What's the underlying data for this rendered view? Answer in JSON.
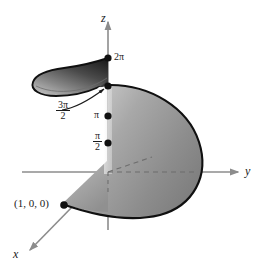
{
  "figure": {
    "background_color": "#ffffff",
    "axes": {
      "x_label": "x",
      "y_label": "y",
      "z_label": "z",
      "axis_color": "#8c8c8c"
    },
    "z_ticks": [
      {
        "label_num": "π",
        "label_den": "2",
        "is_fraction": true,
        "value": "π/2"
      },
      {
        "label_num": "π",
        "label_den": "",
        "is_fraction": false,
        "value": "π"
      },
      {
        "label_num": "3π",
        "label_den": "2",
        "is_fraction": true,
        "value": "3π/2"
      },
      {
        "label_num": "2π",
        "label_den": "",
        "is_fraction": false,
        "value": "2π"
      }
    ],
    "tick_labels": {
      "two_pi": "2π",
      "three_pi_num": "3π",
      "three_pi_den": "2",
      "pi": "π",
      "half_pi_num": "π",
      "half_pi_den": "2"
    },
    "point_label": "(1, 0, 0)",
    "surface": {
      "fill_light": "#b9b9b9",
      "fill_mid": "#8f8f8f",
      "fill_dark": "#3a3a3a",
      "outline_color": "#111111"
    },
    "marker_color": "#111111"
  }
}
